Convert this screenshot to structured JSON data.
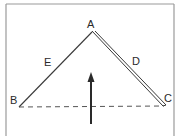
{
  "diagram": {
    "type": "triangle-force-diagram",
    "vertices": {
      "A": {
        "label": "A",
        "x": 92,
        "y": 32
      },
      "B": {
        "label": "B",
        "x": 19,
        "y": 107
      },
      "C": {
        "label": "C",
        "x": 164,
        "y": 106
      }
    },
    "edges": [
      {
        "from": "A",
        "to": "B",
        "label": "E",
        "style": "single-line"
      },
      {
        "from": "A",
        "to": "C",
        "label": "D",
        "style": "double-line"
      },
      {
        "from": "B",
        "to": "C",
        "label": "",
        "style": "dashed"
      }
    ],
    "labels": {
      "a": "A",
      "b": "B",
      "c": "C",
      "d": "D",
      "e": "E"
    },
    "arrow": {
      "direction": "up",
      "x": 91,
      "y_start": 124,
      "y_end": 73
    },
    "colors": {
      "line": "#3a3a3a",
      "border": "#8a8a8a",
      "background": "#ffffff",
      "text": "#2a2a2a"
    }
  }
}
